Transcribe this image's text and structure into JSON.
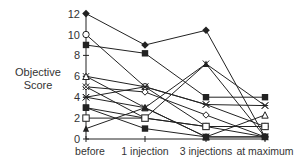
{
  "chart_data": {
    "type": "line",
    "title": "",
    "xlabel": "",
    "ylabel": "Objective Score",
    "ylim": [
      0,
      12
    ],
    "yticks": [
      0,
      2,
      4,
      6,
      8,
      10,
      12
    ],
    "categories": [
      "before",
      "1 injection",
      "3 injections",
      "at maximum"
    ],
    "grid": false,
    "legend": null,
    "series": [
      {
        "name": "patient-1",
        "marker": "filled-diamond",
        "values": [
          12,
          9,
          10.4,
          0.2
        ]
      },
      {
        "name": "patient-2",
        "marker": "open-circle",
        "values": [
          10,
          5,
          1.2,
          1.2
        ]
      },
      {
        "name": "patient-3",
        "marker": "filled-square",
        "values": [
          9,
          8.2,
          4,
          4
        ]
      },
      {
        "name": "patient-4",
        "marker": "asterisk",
        "values": [
          6,
          5,
          3.3,
          3.2
        ]
      },
      {
        "name": "patient-5",
        "marker": "open-triangle",
        "values": [
          6,
          3,
          0.2,
          2.3
        ]
      },
      {
        "name": "patient-6",
        "marker": "open-diamond",
        "values": [
          5,
          4.5,
          2.3,
          0.2
        ]
      },
      {
        "name": "patient-7",
        "marker": "x-cross",
        "values": [
          5,
          2,
          7.2,
          3.2
        ]
      },
      {
        "name": "patient-8",
        "marker": "asterisk",
        "values": [
          4,
          5,
          3.3,
          1.2
        ]
      },
      {
        "name": "patient-9",
        "marker": "x-cross",
        "values": [
          4,
          3,
          0.2,
          0.2
        ]
      },
      {
        "name": "patient-10",
        "marker": "filled-square",
        "values": [
          3,
          1,
          0.2,
          0.2
        ]
      },
      {
        "name": "patient-11",
        "marker": "filled-square",
        "values": [
          3,
          2,
          1.2,
          0.2
        ]
      },
      {
        "name": "patient-12",
        "marker": "open-square",
        "values": [
          2,
          2,
          1.2,
          1.2
        ]
      },
      {
        "name": "patient-13",
        "marker": "filled-triangle",
        "values": [
          1,
          3,
          7.2,
          0.2
        ]
      }
    ]
  },
  "axis": {
    "y_label_line1": "Objective",
    "y_label_line2": "Score"
  }
}
